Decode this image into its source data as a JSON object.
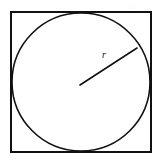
{
  "figure": {
    "background_color": "#ffffff",
    "stroke_color": "#111111",
    "fill_color": "#ffffff",
    "width": 161,
    "height": 167,
    "square": {
      "name": "circumscribed square",
      "x": 11,
      "y": 12,
      "width": 140,
      "height": 140,
      "stroke_width": 2
    },
    "circle": {
      "name": "inscribed circle",
      "cx": 81,
      "cy": 82,
      "r": 69,
      "stroke_width": 1.6
    },
    "radius_segment": {
      "name": "radius",
      "x1": 80,
      "y1": 85,
      "x2": 137,
      "y2": 48,
      "stroke_width": 1.6
    },
    "radius_label": {
      "text": "r",
      "x": 102,
      "y": 50
    },
    "ghost_text": [
      {
        "text": "the",
        "x": 126,
        "y": 2
      },
      {
        "text": "formula",
        "x": 124,
        "y": 14
      },
      {
        "text": "circle",
        "x": 128,
        "y": 26
      },
      {
        "text": "area",
        "x": 130,
        "y": 60
      },
      {
        "text": "length",
        "x": 120,
        "y": 76
      },
      {
        "text": "inscribed",
        "x": 112,
        "y": 90
      },
      {
        "text": "square",
        "x": 120,
        "y": 106
      },
      {
        "text": "with",
        "x": 128,
        "y": 130
      },
      {
        "text": "radius",
        "x": 124,
        "y": 144
      }
    ]
  }
}
